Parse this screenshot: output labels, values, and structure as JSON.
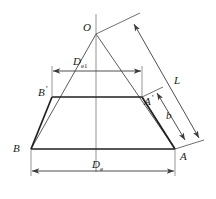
{
  "diagram": {
    "stroke_color": "#2b2b2b",
    "thin_stroke_color": "#555555",
    "label_color": "#1a1a1a",
    "background": "#ffffff"
  },
  "vertices": {
    "apex": "O",
    "top_left": "B",
    "top_left_prime": "'",
    "top_right": "A",
    "top_right_prime": "'",
    "bottom_left": "B",
    "bottom_right": "A"
  },
  "dimensions": {
    "top_diameter": "D",
    "top_diameter_sub": "e1",
    "bottom_diameter": "D",
    "bottom_diameter_sub": "e",
    "full_slant": "L",
    "frustum_slant": "b"
  }
}
